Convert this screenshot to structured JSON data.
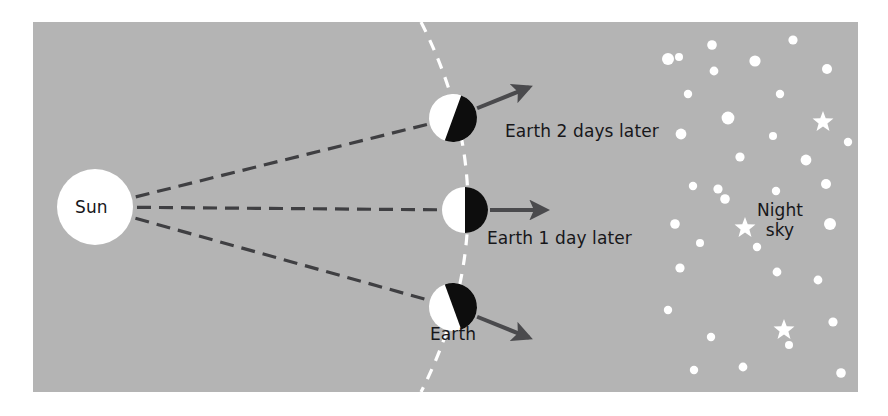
{
  "figure": {
    "title_alt": "Earth rotation and night sky diagram",
    "background_color": "#b4b4b4",
    "page_color": "#ffffff",
    "panel": {
      "x": 33,
      "y": 22,
      "width": 825,
      "height": 370
    }
  },
  "sun": {
    "label": "Sun",
    "color": "#ffffff",
    "center_x": 95,
    "center_y": 207,
    "radius": 38
  },
  "sun_rays": {
    "style": "dashed",
    "color": "#3f3f42",
    "count": 3,
    "dash": "14 8",
    "width": 3.2
  },
  "terminator": {
    "name": "day-night-terminator",
    "style": "dashed",
    "color": "#ffffff",
    "dash": "11 9",
    "width": 3.2
  },
  "earths": [
    {
      "label": "Earth 2 days later",
      "center_x": 453,
      "center_y": 118,
      "radius": 24,
      "tilt_deg": 20,
      "day_color": "#ffffff",
      "night_color": "#0d0d0d",
      "arrow_angle_deg": -22,
      "label_x": 505,
      "label_y": 121
    },
    {
      "label": "Earth 1 day later",
      "center_x": 465,
      "center_y": 210,
      "radius": 23,
      "tilt_deg": 0,
      "day_color": "#ffffff",
      "night_color": "#0d0d0d",
      "arrow_angle_deg": 0,
      "label_x": 487,
      "label_y": 228
    },
    {
      "label": "Earth",
      "center_x": 453,
      "center_y": 307,
      "radius": 24,
      "tilt_deg": -20,
      "day_color": "#ffffff",
      "night_color": "#0d0d0d",
      "arrow_angle_deg": 22,
      "label_x": 453,
      "label_y": 324
    }
  ],
  "night_sky": {
    "label_line1": "Night",
    "label_line2": "sky",
    "label_x": 780,
    "label_y": 200,
    "star_color": "#ffffff",
    "dots": [
      {
        "x": 679,
        "y": 57,
        "r": 4.0
      },
      {
        "x": 712,
        "y": 45,
        "r": 4.8
      },
      {
        "x": 793,
        "y": 40,
        "r": 4.6
      },
      {
        "x": 668,
        "y": 59,
        "r": 6.0
      },
      {
        "x": 714,
        "y": 71,
        "r": 4.4
      },
      {
        "x": 755,
        "y": 61,
        "r": 5.6
      },
      {
        "x": 827,
        "y": 69,
        "r": 5.0
      },
      {
        "x": 688,
        "y": 94,
        "r": 4.2
      },
      {
        "x": 780,
        "y": 94,
        "r": 4.2
      },
      {
        "x": 728,
        "y": 118,
        "r": 6.4
      },
      {
        "x": 681,
        "y": 134,
        "r": 5.4
      },
      {
        "x": 773,
        "y": 136,
        "r": 4.0
      },
      {
        "x": 848,
        "y": 142,
        "r": 4.2
      },
      {
        "x": 740,
        "y": 157,
        "r": 4.6
      },
      {
        "x": 806,
        "y": 160,
        "r": 5.4
      },
      {
        "x": 718,
        "y": 189,
        "r": 4.6
      },
      {
        "x": 693,
        "y": 186,
        "r": 4.2
      },
      {
        "x": 826,
        "y": 184,
        "r": 5.0
      },
      {
        "x": 776,
        "y": 191,
        "r": 4.2
      },
      {
        "x": 725,
        "y": 199,
        "r": 4.8
      },
      {
        "x": 830,
        "y": 224,
        "r": 6.0
      },
      {
        "x": 675,
        "y": 224,
        "r": 4.8
      },
      {
        "x": 680,
        "y": 268,
        "r": 4.6
      },
      {
        "x": 777,
        "y": 272,
        "r": 4.4
      },
      {
        "x": 818,
        "y": 280,
        "r": 4.4
      },
      {
        "x": 668,
        "y": 310,
        "r": 4.2
      },
      {
        "x": 833,
        "y": 322,
        "r": 4.6
      },
      {
        "x": 711,
        "y": 337,
        "r": 4.2
      },
      {
        "x": 789,
        "y": 345,
        "r": 4.0
      },
      {
        "x": 694,
        "y": 370,
        "r": 4.2
      },
      {
        "x": 743,
        "y": 367,
        "r": 4.4
      },
      {
        "x": 841,
        "y": 373,
        "r": 4.8
      },
      {
        "x": 700,
        "y": 243,
        "r": 4.0
      },
      {
        "x": 757,
        "y": 247,
        "r": 4.2
      }
    ],
    "stars": [
      {
        "x": 823,
        "y": 122,
        "r": 11
      },
      {
        "x": 745,
        "y": 228,
        "r": 11
      },
      {
        "x": 784,
        "y": 330,
        "r": 11
      }
    ]
  }
}
